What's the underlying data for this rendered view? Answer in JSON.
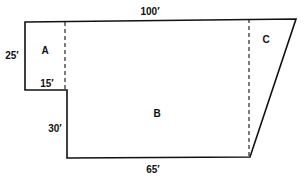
{
  "diagram": {
    "type": "floor-plan",
    "regions": [
      {
        "id": "A",
        "label": "A"
      },
      {
        "id": "B",
        "label": "B"
      },
      {
        "id": "C",
        "label": "C"
      }
    ],
    "dimensions": {
      "top": "100′",
      "left": "25′",
      "step": "15′",
      "inner_left": "30′",
      "bottom": "65′"
    },
    "colors": {
      "stroke": "#111111",
      "background": "#ffffff"
    }
  }
}
